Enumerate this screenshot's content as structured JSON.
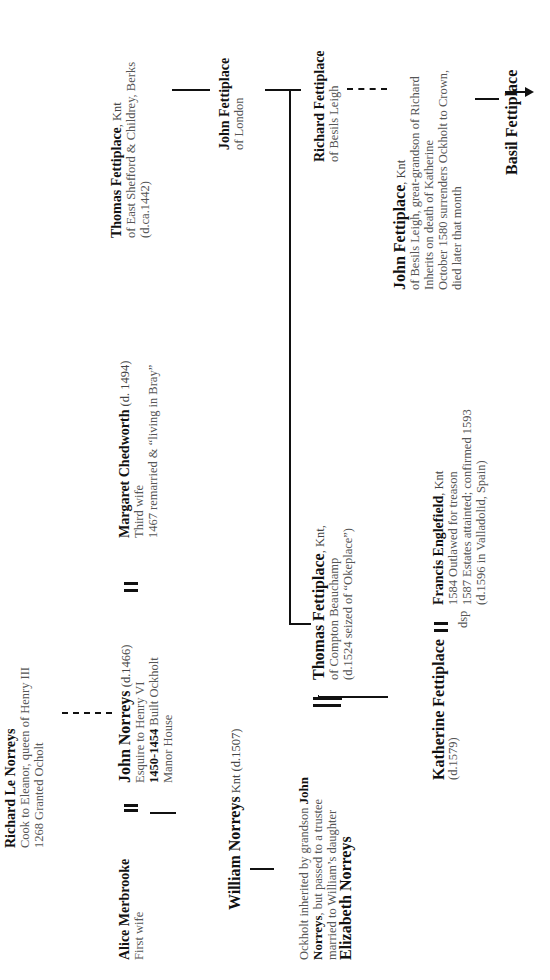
{
  "orientation": "rotated 90 degrees counter-clockwise",
  "people": {
    "richard_le_norreys": {
      "name": "Richard Le Norreys",
      "details": [
        "Cook to Eleanor, queen of Henry III",
        "1268 Granted Ocholt"
      ]
    },
    "alice_merbrooke": {
      "name": "Alice Merbrooke",
      "details": [
        "First wife"
      ]
    },
    "john_norreys": {
      "name": "John Norreys",
      "suffix": " (d.1466)",
      "detail1": "Esquire to Henry VI",
      "detail2_bold": "1450-1454",
      "detail2_rest": " Built Ockholt",
      "detail3": "Manor House"
    },
    "margaret_chedworth": {
      "name": "Margaret Chedworth",
      "suffix": " (d. 1494)",
      "details": [
        "Third wife",
        "1467 remarried & “living in Bray”"
      ]
    },
    "william_norreys": {
      "name": "William Norreys",
      "suffix": " Knt (d.1507)"
    },
    "ockholt_note": {
      "line1_plain": "Ockholt inherited by grandson ",
      "line1_bold": "John",
      "line2_bold": "Norreys",
      "line2_plain": ", but passed to a trustee",
      "line3": "married to William’s daughter"
    },
    "elizabeth_norreys": {
      "name": "Elizabeth Norreys"
    },
    "thomas_fettiplace_east_shefford": {
      "name": "Thomas Fettiplace",
      "suffix": ", Knt",
      "details": [
        "of East Shefford & Childrey, Berks",
        "(d.ca.1442)"
      ]
    },
    "john_fettiplace_london": {
      "name": "John Fettiplace",
      "details": [
        "of London"
      ]
    },
    "richard_fettiplace": {
      "name": "Richard Fettiplace",
      "details": [
        "of Besils Leigh"
      ]
    },
    "thomas_fettiplace_compton": {
      "name": "Thomas Fettiplace",
      "suffix": ", Knt,",
      "details": [
        "of Compton Beauchamp",
        "(d.1524 seized of “Okeplace”)"
      ]
    },
    "katherine_fettiplace": {
      "name": "Katherine Fettiplace",
      "details": [
        "(d.1579)"
      ]
    },
    "francis_englefield": {
      "name": "Francis Englefield",
      "suffix": ", Knt",
      "details": [
        "1584 Outlawed for treason",
        "1587 Estates attainted; confirmed 1593",
        "(d.1596 in Valladolid, Spain)"
      ]
    },
    "john_fettiplace_besils": {
      "name": "John Fettiplace",
      "suffix": ", Knt",
      "details": [
        "of Besils Leigh, great-grandson of Richard",
        "Inherits on death of Katherine",
        "October 1580 surrenders Ockholt to Crown,",
        "died later that month"
      ]
    },
    "basil_fettiplace": {
      "name": "Basil Fettiplace"
    }
  },
  "labels": {
    "dsp": "dsp"
  },
  "icons": {
    "marriage": "double-line-icon",
    "descent_arrow": "arrow-right-icon"
  }
}
